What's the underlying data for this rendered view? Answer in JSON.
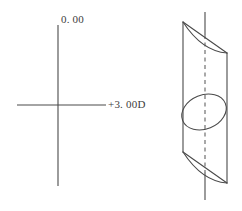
{
  "figure": {
    "name": "plano-cylindrical-lens-power-cross-diagram",
    "background_color": "#ffffff",
    "stroke_color": "#4a4a4a",
    "text_color": "#3d3d3d",
    "power_cross": {
      "vertical_meridian_label": "0. 00",
      "horizontal_meridian_label": "+3. 00D"
    },
    "lens": {
      "axis_line_style_outside": "solid",
      "axis_line_style_inside": "dashed",
      "front_surface_shape": "ellipse"
    }
  }
}
